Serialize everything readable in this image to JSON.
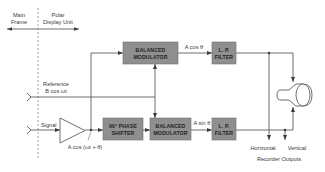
{
  "diagram": {
    "type": "block-diagram",
    "sections": {
      "left": {
        "line1": "Main",
        "line2": "Frame"
      },
      "right": {
        "line1": "Polar",
        "line2": "Display Unit"
      }
    },
    "blocks": {
      "balanced_modulator_top": {
        "line1": "BALANCED",
        "line2": "MODULATOR"
      },
      "lp_filter_top": {
        "line1": "L. P.",
        "line2": "FILTER"
      },
      "phase_shifter": {
        "line1": "90° PHASE",
        "line2": "SHIFTER"
      },
      "balanced_modulator_bottom": {
        "line1": "BALANCED",
        "line2": "MODULATOR"
      },
      "lp_filter_bottom": {
        "line1": "L. P.",
        "line2": "FILTER"
      }
    },
    "signals": {
      "reference_line1": "Reference",
      "reference_line2": "B cos ωt",
      "signal": "Signal",
      "amplifier_output": "A cos (ωt + θ)",
      "cos_output": "A cos θ",
      "sin_output": "A sin θ"
    },
    "outputs": {
      "horizontal": "Horizontal",
      "vertical": "Vertical",
      "caption": "Recorder Outputs"
    },
    "icons": {
      "amplifier": "triangle-amplifier-icon",
      "display": "crt-display-icon",
      "input_connector": "input-connector-icon"
    },
    "colors": {
      "block_fill": "#8f8f8f",
      "line": "#4a4a4a",
      "text": "#3a3a3a"
    }
  }
}
